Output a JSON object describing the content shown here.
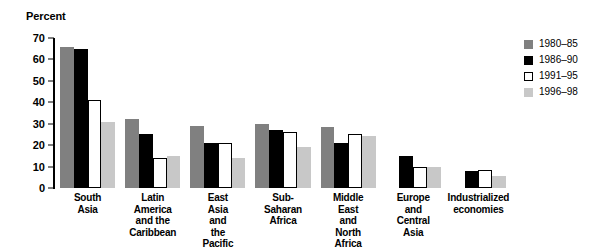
{
  "chart_data": {
    "type": "bar",
    "title": "",
    "ylabel": "Percent",
    "xlabel": "",
    "ylim": [
      0,
      70
    ],
    "yticks": [
      0,
      10,
      20,
      30,
      40,
      50,
      60,
      70
    ],
    "grid": false,
    "legend_position": "right",
    "categories": [
      "South Asia",
      "Latin America\nand the\nCaribbean",
      "East Asia\nand the\nPacific",
      "Sub-Saharan\nAfrica",
      "Middle East\nand\nNorth Africa",
      "Europe and\nCentral Asia",
      "Industrialized\neconomies"
    ],
    "series": [
      {
        "name": "1980–85",
        "color": "#808080",
        "values": [
          66,
          32,
          29,
          30,
          28.5,
          null,
          null
        ]
      },
      {
        "name": "1986–90",
        "color": "#000000",
        "values": [
          65,
          25,
          21,
          27,
          21,
          15,
          8
        ]
      },
      {
        "name": "1991–95",
        "color": "#ffffff",
        "values": [
          41,
          14,
          21,
          26,
          25,
          10,
          8.5
        ]
      },
      {
        "name": "1996–98",
        "color": "#c8c8c8",
        "values": [
          31,
          15,
          14,
          19,
          24.5,
          10,
          5.5
        ]
      }
    ]
  },
  "legend": {
    "items": [
      {
        "label": "1980–85",
        "swatch": "dark-gray-swatch"
      },
      {
        "label": "1986–90",
        "swatch": "black-swatch"
      },
      {
        "label": "1991–95",
        "swatch": "white-outlined-swatch"
      },
      {
        "label": "1996–98",
        "swatch": "light-gray-swatch"
      }
    ]
  }
}
